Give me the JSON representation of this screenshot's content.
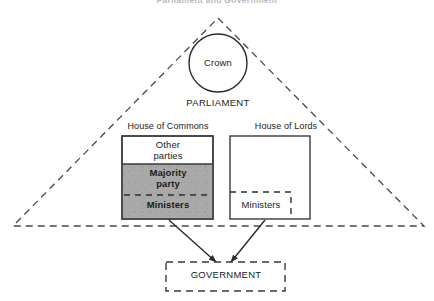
{
  "figure": {
    "title": "Parliament and Government"
  },
  "crown": {
    "label": "Crown"
  },
  "parliament": {
    "label": "PARLIAMENT"
  },
  "commons": {
    "title": "House of Commons",
    "segments": [
      {
        "label": "Other\nparties"
      },
      {
        "label": "Majority\nparty"
      },
      {
        "label": "Ministers"
      }
    ]
  },
  "lords": {
    "title": "House of Lords",
    "ministers_label": "Ministers"
  },
  "government": {
    "label": "GOVERNMENT"
  },
  "colors": {
    "stroke": "#3a3a3a",
    "shaded_fill": "#a9a9a9",
    "background": "#ffffff",
    "text": "#1c1c1c"
  }
}
